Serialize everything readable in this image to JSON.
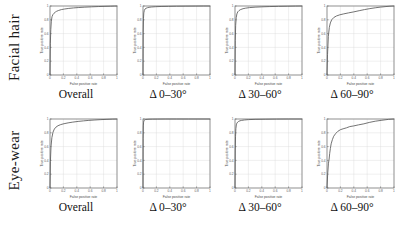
{
  "figure": {
    "rows": [
      {
        "label": "Facial hair"
      },
      {
        "label": "Eye-wear"
      }
    ],
    "captions": [
      "Overall",
      "Δ 0–30°",
      "Δ 30–60°",
      "Δ 60–90°"
    ]
  },
  "axes": {
    "xlabel": "False positive rate",
    "ylabel": "True positive rate",
    "ticks": [
      "0",
      "0.2",
      "0.4",
      "0.6",
      "0.8",
      "1"
    ],
    "xlim": [
      0,
      1
    ],
    "ylim": [
      0,
      1
    ]
  },
  "colors": {
    "curve": "#5a5a5a",
    "axis": "#6e6e6e",
    "grid": "#d8d8d8",
    "text": "#111111",
    "background": "#ffffff"
  },
  "chart_data": [
    {
      "type": "line",
      "title": "Facial hair — Overall",
      "row": "Facial hair",
      "column": "Overall",
      "xlabel": "False positive rate",
      "ylabel": "True positive rate",
      "xlim": [
        0,
        1
      ],
      "ylim": [
        0,
        1
      ],
      "grid": true,
      "legend": "none",
      "series": [
        {
          "name": "ROC",
          "x": [
            0,
            0.005,
            0.012,
            0.02,
            0.03,
            0.045,
            0.06,
            0.08,
            0.1,
            0.13,
            0.17,
            0.22,
            0.28,
            0.35,
            0.43,
            0.52,
            0.62,
            0.72,
            0.82,
            0.9,
            0.96,
            1
          ],
          "y": [
            0,
            0.46,
            0.66,
            0.78,
            0.845,
            0.878,
            0.895,
            0.912,
            0.924,
            0.936,
            0.948,
            0.957,
            0.965,
            0.972,
            0.978,
            0.983,
            0.988,
            0.992,
            0.995,
            0.997,
            0.999,
            1
          ]
        }
      ]
    },
    {
      "type": "line",
      "title": "Facial hair — Δ 0–30°",
      "row": "Facial hair",
      "column": "Δ 0–30°",
      "xlabel": "False positive rate",
      "ylabel": "True positive rate",
      "xlim": [
        0,
        1
      ],
      "ylim": [
        0,
        1
      ],
      "grid": true,
      "legend": "none",
      "series": [
        {
          "name": "ROC",
          "x": [
            0,
            0.003,
            0.007,
            0.012,
            0.02,
            0.03,
            0.045,
            0.065,
            0.09,
            0.13,
            0.19,
            0.27,
            0.38,
            0.5,
            0.64,
            0.78,
            0.9,
            1
          ],
          "y": [
            0,
            0.62,
            0.82,
            0.9,
            0.938,
            0.956,
            0.967,
            0.975,
            0.981,
            0.986,
            0.99,
            0.993,
            0.995,
            0.997,
            0.998,
            0.999,
            1,
            1
          ]
        }
      ]
    },
    {
      "type": "line",
      "title": "Facial hair — Δ 30–60°",
      "row": "Facial hair",
      "column": "Δ 30–60°",
      "xlabel": "False positive rate",
      "ylabel": "True positive rate",
      "xlim": [
        0,
        1
      ],
      "ylim": [
        0,
        1
      ],
      "grid": true,
      "legend": "none",
      "series": [
        {
          "name": "ROC",
          "x": [
            0,
            0.004,
            0.01,
            0.018,
            0.028,
            0.042,
            0.06,
            0.085,
            0.12,
            0.16,
            0.22,
            0.3,
            0.4,
            0.52,
            0.65,
            0.78,
            0.9,
            1
          ],
          "y": [
            0,
            0.5,
            0.72,
            0.83,
            0.885,
            0.916,
            0.934,
            0.949,
            0.961,
            0.969,
            0.977,
            0.983,
            0.988,
            0.992,
            0.995,
            0.997,
            0.999,
            1
          ]
        }
      ]
    },
    {
      "type": "line",
      "title": "Facial hair — Δ 60–90°",
      "row": "Facial hair",
      "column": "Δ 60–90°",
      "xlabel": "False positive rate",
      "ylabel": "True positive rate",
      "xlim": [
        0,
        1
      ],
      "ylim": [
        0,
        1
      ],
      "grid": true,
      "legend": "none",
      "series": [
        {
          "name": "ROC",
          "x": [
            0,
            0.008,
            0.02,
            0.035,
            0.05,
            0.07,
            0.1,
            0.14,
            0.19,
            0.25,
            0.32,
            0.4,
            0.48,
            0.56,
            0.64,
            0.72,
            0.8,
            0.88,
            0.94,
            1
          ],
          "y": [
            0,
            0.3,
            0.56,
            0.69,
            0.755,
            0.8,
            0.832,
            0.855,
            0.872,
            0.886,
            0.9,
            0.915,
            0.932,
            0.948,
            0.962,
            0.974,
            0.984,
            0.992,
            0.997,
            1
          ]
        }
      ]
    },
    {
      "type": "line",
      "title": "Eye-wear — Overall",
      "row": "Eye-wear",
      "column": "Overall",
      "xlabel": "False positive rate",
      "ylabel": "True positive rate",
      "xlim": [
        0,
        1
      ],
      "ylim": [
        0,
        1
      ],
      "grid": true,
      "legend": "none",
      "series": [
        {
          "name": "ROC",
          "x": [
            0,
            0.006,
            0.015,
            0.028,
            0.045,
            0.065,
            0.09,
            0.12,
            0.16,
            0.21,
            0.27,
            0.34,
            0.42,
            0.5,
            0.58,
            0.67,
            0.76,
            0.85,
            0.93,
            1
          ],
          "y": [
            0,
            0.38,
            0.6,
            0.73,
            0.81,
            0.855,
            0.883,
            0.903,
            0.919,
            0.932,
            0.944,
            0.955,
            0.965,
            0.973,
            0.98,
            0.986,
            0.991,
            0.995,
            0.998,
            1
          ]
        }
      ]
    },
    {
      "type": "line",
      "title": "Eye-wear — Δ 0–30°",
      "row": "Eye-wear",
      "column": "Δ 0–30°",
      "xlabel": "False positive rate",
      "ylabel": "True positive rate",
      "xlim": [
        0,
        1
      ],
      "ylim": [
        0,
        1
      ],
      "grid": true,
      "legend": "none",
      "series": [
        {
          "name": "ROC",
          "x": [
            0,
            0.002,
            0.005,
            0.009,
            0.014,
            0.02,
            0.028,
            0.04,
            0.06,
            0.09,
            0.14,
            0.22,
            0.34,
            0.5,
            0.68,
            0.85,
            1
          ],
          "y": [
            0,
            0.72,
            0.9,
            0.955,
            0.975,
            0.984,
            0.989,
            0.993,
            0.995,
            0.997,
            0.998,
            0.999,
            1,
            1,
            1,
            1,
            1
          ]
        }
      ]
    },
    {
      "type": "line",
      "title": "Eye-wear — Δ 30–60°",
      "row": "Eye-wear",
      "column": "Δ 30–60°",
      "xlabel": "False positive rate",
      "ylabel": "True positive rate",
      "xlim": [
        0,
        1
      ],
      "ylim": [
        0,
        1
      ],
      "grid": true,
      "legend": "none",
      "series": [
        {
          "name": "ROC",
          "x": [
            0,
            0.004,
            0.008,
            0.013,
            0.02,
            0.028,
            0.04,
            0.055,
            0.075,
            0.1,
            0.14,
            0.2,
            0.3,
            0.45,
            0.62,
            0.8,
            1
          ],
          "y": [
            0,
            0.55,
            0.75,
            0.86,
            0.915,
            0.94,
            0.955,
            0.966,
            0.974,
            0.98,
            0.986,
            0.991,
            0.995,
            0.997,
            0.999,
            1,
            1
          ]
        }
      ]
    },
    {
      "type": "line",
      "title": "Eye-wear — Δ 60–90°",
      "row": "Eye-wear",
      "column": "Δ 60–90°",
      "xlabel": "False positive rate",
      "ylabel": "True positive rate",
      "xlim": [
        0,
        1
      ],
      "ylim": [
        0,
        1
      ],
      "grid": true,
      "legend": "none",
      "series": [
        {
          "name": "ROC",
          "x": [
            0,
            0.01,
            0.022,
            0.032,
            0.04,
            0.05,
            0.062,
            0.08,
            0.1,
            0.13,
            0.16,
            0.2,
            0.24,
            0.29,
            0.34,
            0.4,
            0.47,
            0.55,
            0.63,
            0.72,
            0.82,
            0.92,
            1
          ],
          "y": [
            0,
            0.2,
            0.36,
            0.42,
            0.5,
            0.57,
            0.64,
            0.7,
            0.75,
            0.79,
            0.82,
            0.845,
            0.858,
            0.872,
            0.89,
            0.9,
            0.915,
            0.93,
            0.95,
            0.968,
            0.982,
            0.995,
            1
          ]
        }
      ]
    }
  ]
}
